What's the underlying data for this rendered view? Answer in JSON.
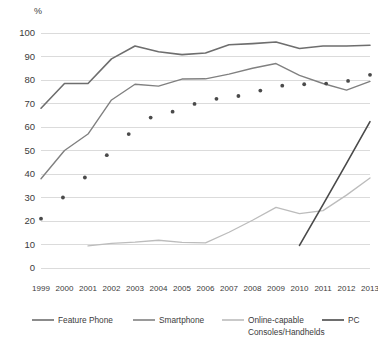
{
  "chart_data": {
    "type": "line",
    "title": "",
    "subtitle": "",
    "xlabel": "",
    "ylabel": "%",
    "ylim": [
      0,
      100
    ],
    "ytick_step": 10,
    "grid": true,
    "legend_position": "bottom",
    "categories": [
      "1999",
      "2000",
      "2001",
      "2002",
      "2003",
      "2004",
      "2005",
      "2006",
      "2007",
      "2008",
      "2009",
      "2010",
      "2011",
      "2012",
      "2013"
    ],
    "yticks": [
      "0",
      "10",
      "20",
      "30",
      "40",
      "50",
      "60",
      "70",
      "80",
      "90",
      "100"
    ],
    "series": [
      {
        "name": "Feature Phone",
        "style": "solid",
        "color": "#6e6e6e",
        "width": 1.6,
        "values": [
          68.0,
          78.5,
          78.5,
          89.0,
          94.5,
          92.0,
          90.8,
          91.5,
          95.0,
          95.5,
          96.2,
          93.4,
          94.5,
          94.5,
          94.8
        ]
      },
      {
        "name": "Smartphone",
        "style": "solid",
        "color": "#808080",
        "width": 1.4,
        "values": [
          38.0,
          50.0,
          57.0,
          71.5,
          78.2,
          77.4,
          80.4,
          80.5,
          82.5,
          85.0,
          87.0,
          82.0,
          78.5,
          75.7,
          79.4
        ]
      },
      {
        "name": "Online-capable Consoles/Handhelds",
        "style": "solid",
        "color": "#bcbcbc",
        "width": 1.3,
        "values": [
          null,
          null,
          9.4,
          10.5,
          11.0,
          11.8,
          10.9,
          10.7,
          15.2,
          20.3,
          25.8,
          23.1,
          24.4,
          31.0,
          38.3
        ]
      },
      {
        "name": "PC",
        "style": "dotted-then-solid",
        "color": "#4a4a4a",
        "width": 1.6,
        "dotted_values": [
          21.0,
          30.0,
          38.5,
          48.0,
          57.0,
          64.0,
          66.5,
          69.8,
          72.0,
          73.2,
          75.5,
          77.6,
          78.2,
          78.5,
          79.6,
          82.2
        ],
        "solid_values": [
          null,
          null,
          null,
          null,
          null,
          null,
          null,
          null,
          null,
          null,
          null,
          9.6,
          27.0,
          44.5,
          62.3
        ]
      }
    ]
  },
  "legend": {
    "items": [
      {
        "label": "Feature Phone",
        "color": "#6e6e6e"
      },
      {
        "label": "Smartphone",
        "color": "#808080"
      },
      {
        "label": "Online-capable",
        "label2": "Consoles/Handhelds",
        "color": "#bcbcbc"
      },
      {
        "label": "PC",
        "color": "#4a4a4a"
      }
    ]
  },
  "axis": {
    "y_unit": "%"
  }
}
